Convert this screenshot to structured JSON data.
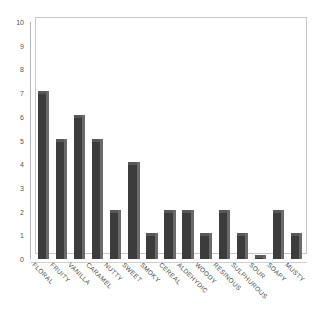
{
  "chart_data": {
    "type": "bar",
    "title": "",
    "subtitle": "",
    "xlabel": "",
    "ylabel": "",
    "ylim": [
      0,
      10
    ],
    "yticks": [
      0,
      1,
      2,
      3,
      4,
      5,
      6,
      7,
      8,
      9,
      10
    ],
    "grid": false,
    "legend": null,
    "style": "3d-bar-grayscale",
    "bar_color": "#3c3c3c",
    "bar_side_color": "#6a6a6a",
    "background_color": "#ffffff",
    "categories": [
      "FLORAL",
      "FRUITY",
      "VANILLA",
      "CARAMEL",
      "NUTTY",
      "SWEET",
      "SMOKY",
      "CEREAL",
      "ALDEHYDIC",
      "WOODY",
      "RESINOUS",
      "SULPHUROUS",
      "SOUR",
      "SOAPY",
      "MUSTY"
    ],
    "values": [
      7,
      5,
      6,
      5,
      2,
      4,
      1,
      2,
      2,
      1,
      2,
      1,
      0.1,
      2,
      1
    ]
  }
}
